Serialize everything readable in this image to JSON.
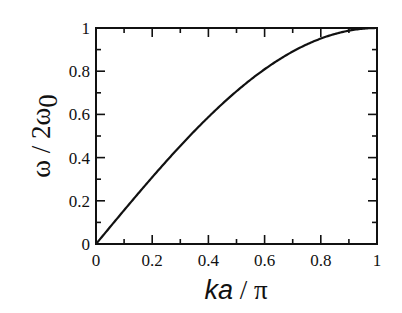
{
  "chart_data": {
    "type": "line",
    "title": "",
    "xlabel": "ka / π",
    "ylabel": "ω / 2ω0",
    "xlim": [
      0,
      1
    ],
    "ylim": [
      0,
      1
    ],
    "grid": false,
    "legend": null,
    "x_ticks": [
      "0",
      "0.2",
      "0.4",
      "0.6",
      "0.8",
      "1"
    ],
    "y_ticks": [
      "0",
      "0.2",
      "0.4",
      "0.6",
      "0.8",
      "1"
    ],
    "series": [
      {
        "name": "dispersion",
        "function": "sin(pi*x/2)",
        "x": [
          0,
          0.1,
          0.2,
          0.3,
          0.4,
          0.5,
          0.6,
          0.7,
          0.8,
          0.9,
          1.0
        ],
        "values": [
          0,
          0.156,
          0.309,
          0.454,
          0.588,
          0.707,
          0.809,
          0.891,
          0.951,
          0.988,
          1.0
        ]
      }
    ]
  },
  "labels": {
    "x_axis_ka": "ka",
    "x_axis_rest": " / π",
    "y_axis_main": "ω / 2ω",
    "y_axis_sub": "0"
  },
  "ticks": {
    "x": [
      "0",
      "0.2",
      "0.4",
      "0.6",
      "0.8",
      "1"
    ],
    "y": [
      "0",
      "0.2",
      "0.4",
      "0.6",
      "0.8",
      "1"
    ]
  }
}
